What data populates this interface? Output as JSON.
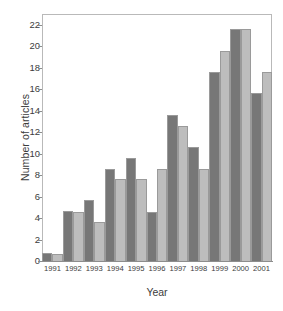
{
  "chart_data": {
    "type": "bar",
    "title": "",
    "xlabel": "Year",
    "ylabel": "Number of articles",
    "categories": [
      "1991",
      "1992",
      "1993",
      "1994",
      "1995",
      "1996",
      "1997",
      "1998",
      "1999",
      "2000",
      "2001"
    ],
    "series": [
      {
        "name": "series-a",
        "color": "#777777",
        "values": [
          0.7,
          4.7,
          5.7,
          8.6,
          9.6,
          4.6,
          13.6,
          10.6,
          17.6,
          21.6,
          15.6
        ]
      },
      {
        "name": "series-b",
        "color": "#bdbdbd",
        "values": [
          0.65,
          4.6,
          3.6,
          7.6,
          7.6,
          8.6,
          12.6,
          8.6,
          19.6,
          21.6,
          17.6
        ]
      }
    ],
    "ylim": [
      0,
      23
    ],
    "yticks": [
      0,
      2,
      4,
      6,
      8,
      10,
      12,
      14,
      16,
      18,
      20,
      22
    ],
    "ytick_labels": [
      "0",
      "2",
      "4",
      "6",
      "8",
      "10",
      "12",
      "14",
      "16",
      "18",
      "20",
      "22"
    ],
    "grid": false,
    "legend": "none",
    "bar_border_color": "#9a9a9a",
    "frame_color": "#b9b9b9",
    "axis_color": "#8d8d8d",
    "background": "#ffffff"
  }
}
